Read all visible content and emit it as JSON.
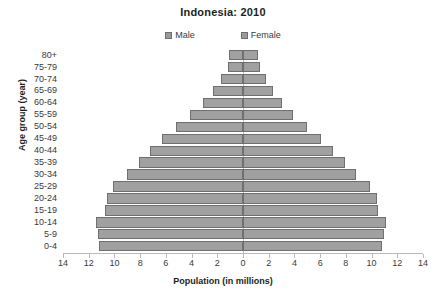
{
  "chart_data": {
    "type": "bar",
    "subtype": "population-pyramid",
    "title": "Indonesia: 2010",
    "xlabel": "Population (in millions)",
    "ylabel": "Age group (year)",
    "grid": false,
    "legend_position": "top-center",
    "axis_max": 14,
    "xtick_labels": [
      "14",
      "12",
      "10",
      "8",
      "6",
      "4",
      "2",
      "0",
      "2",
      "4",
      "6",
      "8",
      "10",
      "12",
      "14"
    ],
    "xtick_values": [
      -14,
      -12,
      -10,
      -8,
      -6,
      -4,
      -2,
      0,
      2,
      4,
      6,
      8,
      10,
      12,
      14
    ],
    "categories": [
      "80+",
      "75-79",
      "70-74",
      "65-69",
      "60-64",
      "55-59",
      "50-54",
      "45-49",
      "40-44",
      "35-39",
      "30-34",
      "25-29",
      "20-24",
      "15-19",
      "10-14",
      "5-9",
      "0-4"
    ],
    "series": [
      {
        "name": "Male",
        "side": "left",
        "color": "#a0a0a0",
        "values": [
          1.1,
          1.2,
          1.7,
          2.3,
          3.1,
          4.1,
          5.2,
          6.3,
          7.2,
          8.1,
          9.0,
          10.1,
          10.6,
          10.7,
          11.4,
          11.3,
          11.2
        ]
      },
      {
        "name": "Female",
        "side": "right",
        "color": "#a0a0a0",
        "values": [
          1.2,
          1.3,
          1.8,
          2.3,
          3.0,
          3.9,
          5.0,
          6.1,
          7.0,
          7.9,
          8.8,
          9.9,
          10.4,
          10.5,
          11.1,
          11.0,
          10.8
        ]
      }
    ]
  },
  "legend": {
    "items": [
      {
        "label": "Male"
      },
      {
        "label": "Female"
      }
    ]
  }
}
